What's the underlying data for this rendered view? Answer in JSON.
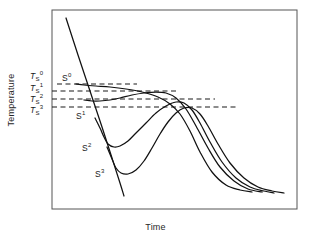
{
  "figure": {
    "background": "#ffffff",
    "frame_color": "#555555",
    "curve_color": "#111111",
    "dash_color": "#1a1a1a"
  },
  "axes": {
    "xlabel": "Time",
    "ylabel": "Temperature",
    "frame": {
      "x0": 52,
      "y0": 10,
      "x1": 297,
      "y1": 209
    },
    "grid": false,
    "ticks": false
  },
  "threshold_labels": [
    {
      "base": "T",
      "sub": "S",
      "sup": "0",
      "x": 30,
      "y": 70
    },
    {
      "base": "T",
      "sub": "S",
      "sup": "1",
      "x": 30,
      "y": 82
    },
    {
      "base": "T",
      "sub": "S",
      "sup": "2",
      "x": 30,
      "y": 93
    },
    {
      "base": "T",
      "sub": "S",
      "sup": "3",
      "x": 30,
      "y": 104
    }
  ],
  "curve_labels": [
    {
      "base": "S",
      "sup": "0",
      "x": 62,
      "y": 72
    },
    {
      "base": "S",
      "sup": "1",
      "x": 76,
      "y": 110
    },
    {
      "base": "S",
      "sup": "2",
      "x": 82,
      "y": 142
    },
    {
      "base": "S",
      "sup": "3",
      "x": 95,
      "y": 168
    }
  ],
  "chart_data": {
    "type": "line",
    "title": "",
    "xlabel": "Time",
    "ylabel": "Temperature",
    "xlim": [
      0,
      1
    ],
    "ylim": [
      0,
      1
    ],
    "grid": false,
    "legend": "none",
    "axis_ticks": "none",
    "annotations": [
      {
        "text": "Ts^0",
        "kind": "threshold-level",
        "level_index": 0
      },
      {
        "text": "Ts^1",
        "kind": "threshold-level",
        "level_index": 1
      },
      {
        "text": "Ts^2",
        "kind": "threshold-level",
        "level_index": 2
      },
      {
        "text": "Ts^3",
        "kind": "threshold-level",
        "level_index": 3
      },
      {
        "text": "S^0",
        "kind": "curve-label",
        "series_index": 0
      },
      {
        "text": "S^1",
        "kind": "curve-label",
        "series_index": 1
      },
      {
        "text": "S^2",
        "kind": "curve-label",
        "series_index": 2
      },
      {
        "text": "S^3",
        "kind": "curve-label",
        "series_index": 3
      }
    ],
    "threshold_lines": [
      {
        "name": "Ts^0",
        "y_px": 84,
        "x_start_px": 57,
        "x_end_px": 137,
        "style": "dashed"
      },
      {
        "name": "Ts^1",
        "y_px": 91,
        "x_start_px": 52,
        "x_end_px": 176,
        "style": "dashed"
      },
      {
        "name": "Ts^2",
        "y_px": 99,
        "x_start_px": 52,
        "x_end_px": 215,
        "style": "dashed"
      },
      {
        "name": "Ts^3",
        "y_px": 107,
        "x_start_px": 52,
        "x_end_px": 236,
        "style": "dashed"
      }
    ],
    "series": [
      {
        "name": "cooling-line",
        "style": "solid",
        "points_px": [
          [
            66,
            18
          ],
          [
            78,
            55
          ],
          [
            90,
            91
          ],
          [
            102,
            127
          ],
          [
            112,
            158
          ],
          [
            120,
            183
          ],
          [
            124,
            196
          ]
        ]
      },
      {
        "name": "S0",
        "style": "solid",
        "points_px": [
          [
            76,
            84
          ],
          [
            84,
            85
          ],
          [
            96,
            86
          ],
          [
            110,
            87
          ],
          [
            126,
            89
          ],
          [
            142,
            92
          ],
          [
            158,
            97
          ],
          [
            170,
            104
          ],
          [
            180,
            114
          ],
          [
            190,
            131
          ],
          [
            200,
            152
          ],
          [
            212,
            172
          ],
          [
            226,
            185
          ],
          [
            240,
            190
          ],
          [
            252,
            192
          ]
        ]
      },
      {
        "name": "S1",
        "style": "solid",
        "points_px": [
          [
            84,
            100
          ],
          [
            92,
            101
          ],
          [
            100,
            101
          ],
          [
            110,
            100
          ],
          [
            120,
            98
          ],
          [
            132,
            95
          ],
          [
            144,
            93
          ],
          [
            156,
            92
          ],
          [
            166,
            93
          ],
          [
            176,
            98
          ],
          [
            186,
            109
          ],
          [
            196,
            126
          ],
          [
            208,
            148
          ],
          [
            220,
            167
          ],
          [
            234,
            181
          ],
          [
            248,
            189
          ],
          [
            262,
            192
          ]
        ]
      },
      {
        "name": "S2",
        "style": "solid",
        "points_px": [
          [
            95,
            118
          ],
          [
            100,
            128
          ],
          [
            104,
            137
          ],
          [
            108,
            144
          ],
          [
            114,
            147
          ],
          [
            120,
            146
          ],
          [
            128,
            141
          ],
          [
            136,
            133
          ],
          [
            146,
            123
          ],
          [
            156,
            113
          ],
          [
            166,
            106
          ],
          [
            176,
            102
          ],
          [
            184,
            103
          ],
          [
            192,
            110
          ],
          [
            200,
            123
          ],
          [
            210,
            142
          ],
          [
            222,
            162
          ],
          [
            236,
            178
          ],
          [
            250,
            187
          ],
          [
            264,
            191
          ],
          [
            274,
            193
          ]
        ]
      },
      {
        "name": "S3",
        "style": "solid",
        "points_px": [
          [
            107,
            147
          ],
          [
            112,
            159
          ],
          [
            116,
            168
          ],
          [
            121,
            173
          ],
          [
            128,
            174
          ],
          [
            136,
            170
          ],
          [
            144,
            161
          ],
          [
            152,
            148
          ],
          [
            160,
            134
          ],
          [
            168,
            122
          ],
          [
            176,
            113
          ],
          [
            184,
            108
          ],
          [
            192,
            108
          ],
          [
            200,
            114
          ],
          [
            208,
            126
          ],
          [
            218,
            144
          ],
          [
            230,
            163
          ],
          [
            244,
            178
          ],
          [
            258,
            187
          ],
          [
            272,
            191
          ],
          [
            284,
            193
          ]
        ]
      }
    ]
  }
}
